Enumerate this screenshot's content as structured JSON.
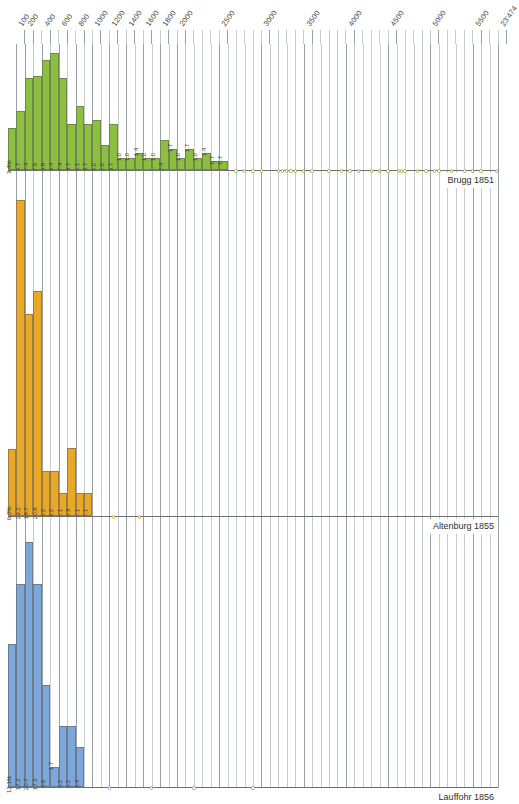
{
  "chart_data": {
    "type": "bar",
    "title": "",
    "subtitle": "",
    "xlabel": "",
    "ylabel": "",
    "orientation": "vertical-histograms-stacked-panels",
    "grid": true,
    "legend_position": "right-inline",
    "axis": {
      "position": "top",
      "xlim": [
        0,
        5800
      ],
      "tick_step": 100,
      "tick_labels": [
        {
          "value": 100,
          "text": "100"
        },
        {
          "value": 200,
          "text": "200"
        },
        {
          "value": 400,
          "text": "400"
        },
        {
          "value": 600,
          "text": "600"
        },
        {
          "value": 800,
          "text": "800"
        },
        {
          "value": 1000,
          "text": "1000"
        },
        {
          "value": 1200,
          "text": "1200"
        },
        {
          "value": 1400,
          "text": "1400"
        },
        {
          "value": 1600,
          "text": "1600"
        },
        {
          "value": 1800,
          "text": "1800"
        },
        {
          "value": 2000,
          "text": "2000"
        },
        {
          "value": 2500,
          "text": "2500"
        },
        {
          "value": 3000,
          "text": "3000"
        },
        {
          "value": 3500,
          "text": "3500"
        },
        {
          "value": 4000,
          "text": "4000"
        },
        {
          "value": 4500,
          "text": "4500"
        },
        {
          "value": 5000,
          "text": "5000"
        },
        {
          "value": 5500,
          "text": "5500"
        },
        {
          "value": 5800,
          "text": "23'474"
        }
      ],
      "major_ticks": [
        100,
        200,
        400,
        600,
        800,
        1000,
        1200,
        1400,
        1600,
        1800,
        2000,
        2500,
        3000,
        3500,
        4000,
        4500,
        5000,
        5500,
        5800
      ]
    },
    "value_unit": "%",
    "series": [
      {
        "name": "Brugg 1851",
        "color": "#8CBE3F",
        "panel": "top",
        "ymax": 10.0,
        "bins": [
          {
            "x": 100,
            "value": 3.4,
            "label": "3.4%"
          },
          {
            "x": 200,
            "value": 4.7,
            "label": "4.7"
          },
          {
            "x": 300,
            "value": 7.4,
            "label": "7.4"
          },
          {
            "x": 400,
            "value": 7.5,
            "label": "7.5"
          },
          {
            "x": 500,
            "value": 8.8,
            "label": "8.8"
          },
          {
            "x": 600,
            "value": 9.4,
            "label": "9.4"
          },
          {
            "x": 700,
            "value": 7.4,
            "label": "7.4"
          },
          {
            "x": 800,
            "value": 3.7,
            "label": "3.7"
          },
          {
            "x": 900,
            "value": 5.1,
            "label": "5.1"
          },
          {
            "x": 1000,
            "value": 3.7,
            "label": "3.7"
          },
          {
            "x": 1100,
            "value": 4.0,
            "label": "4.0"
          },
          {
            "x": 1200,
            "value": 2.0,
            "label": "2.0"
          },
          {
            "x": 1300,
            "value": 3.7,
            "label": "3.7"
          },
          {
            "x": 1400,
            "value": 1.0,
            "label": "1.0"
          },
          {
            "x": 1500,
            "value": 1.0,
            "label": "1.0"
          },
          {
            "x": 1600,
            "value": 1.4,
            "label": "1.4"
          },
          {
            "x": 1700,
            "value": 1.0,
            "label": "1.0"
          },
          {
            "x": 1800,
            "value": 1.0,
            "label": "1.0"
          },
          {
            "x": 1900,
            "value": 2.4,
            "label": "2.4"
          },
          {
            "x": 2000,
            "value": 1.7,
            "label": "1.7"
          },
          {
            "x": 2100,
            "value": 1.0,
            "label": "1.0"
          },
          {
            "x": 2200,
            "value": 1.7,
            "label": "1.7"
          },
          {
            "x": 2300,
            "value": 1.0,
            "label": "1.0"
          },
          {
            "x": 2400,
            "value": 1.4,
            "label": "1.4"
          },
          {
            "x": 2500,
            "value": 0.7,
            "label": "0.7"
          },
          {
            "x": 2600,
            "value": 0.7,
            "label": "0.7"
          }
        ],
        "markers": [
          2700,
          2800,
          2900,
          3000,
          3200,
          3250,
          3300,
          3350,
          3400,
          3500,
          3600,
          3800,
          3950,
          4050,
          4150,
          4300,
          4400,
          4500,
          4620,
          4660,
          4700,
          4850,
          4950,
          5050,
          5100,
          5250,
          5400,
          5500,
          5600,
          5780
        ]
      },
      {
        "name": "Altenburg 1855",
        "color": "#E9A827",
        "panel": "middle",
        "ymax": 31.0,
        "bins": [
          {
            "x": 100,
            "value": 6.2,
            "label": "6.2%"
          },
          {
            "x": 200,
            "value": 29.2,
            "label": "29.2"
          },
          {
            "x": 300,
            "value": 18.7,
            "label": "18.7"
          },
          {
            "x": 400,
            "value": 20.8,
            "label": "20.8"
          },
          {
            "x": 500,
            "value": 4.2,
            "label": "4.2"
          },
          {
            "x": 600,
            "value": 4.2,
            "label": "4.2"
          },
          {
            "x": 700,
            "value": 2.1,
            "label": "2.1"
          },
          {
            "x": 800,
            "value": 6.3,
            "label": "6.3"
          },
          {
            "x": 900,
            "value": 2.1,
            "label": "2.1"
          },
          {
            "x": 1000,
            "value": 2.1,
            "label": "2.1"
          }
        ],
        "markers": [
          1250,
          1560
        ]
      },
      {
        "name": "Lauffohr 1856",
        "color": "#7DA7D9",
        "panel": "bottom",
        "ymax": 22.0,
        "bins": [
          {
            "x": 100,
            "value": 12.1,
            "label": "12.1%"
          },
          {
            "x": 200,
            "value": 17.2,
            "label": "17.2"
          },
          {
            "x": 300,
            "value": 20.7,
            "label": "20.7"
          },
          {
            "x": 400,
            "value": 17.2,
            "label": "17.2"
          },
          {
            "x": 500,
            "value": 8.6,
            "label": "8.6"
          },
          {
            "x": 600,
            "value": 1.7,
            "label": "1.7"
          },
          {
            "x": 700,
            "value": 5.2,
            "label": "5.2"
          },
          {
            "x": 800,
            "value": 5.2,
            "label": "5.2"
          },
          {
            "x": 900,
            "value": 3.4,
            "label": "3.4"
          }
        ],
        "markers": [
          1200,
          1700,
          2200,
          2900
        ]
      }
    ]
  },
  "colors": {
    "green": "#8CBE3F",
    "orange": "#E9A827",
    "blue": "#7DA7D9",
    "grid": "#c9cdd2",
    "grid_major": "#9aa0a6",
    "baseline": "#6f6f6f",
    "text": "#3b3b3b",
    "background": "#ffffff"
  }
}
